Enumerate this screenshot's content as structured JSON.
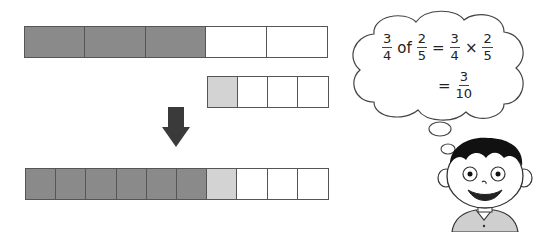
{
  "colors": {
    "shaded": "#8a8a8a",
    "partial": "#d3d3d3",
    "empty": "#ffffff",
    "border": "#555555",
    "arrow": "#3a3a3a"
  },
  "bars": {
    "top": {
      "label": "2/5",
      "cells": [
        "dark",
        "dark",
        "dark",
        "white",
        "white"
      ]
    },
    "middle": {
      "label": "1/4 of each fifth",
      "cells": [
        "light",
        "white",
        "white",
        "white"
      ]
    },
    "bottom": {
      "label": "3/10",
      "cells": [
        "dark",
        "dark",
        "dark",
        "dark",
        "dark",
        "dark",
        "light",
        "white",
        "white",
        "white"
      ]
    }
  },
  "thought": {
    "line1": {
      "f1": {
        "num": "3",
        "den": "4"
      },
      "word": "of",
      "f2": {
        "num": "2",
        "den": "5"
      },
      "eq": "=",
      "f3": {
        "num": "3",
        "den": "4"
      },
      "times": "×",
      "f4": {
        "num": "2",
        "den": "5"
      }
    },
    "line2": {
      "eq": "=",
      "f5": {
        "num": "3",
        "den": "10"
      }
    }
  }
}
